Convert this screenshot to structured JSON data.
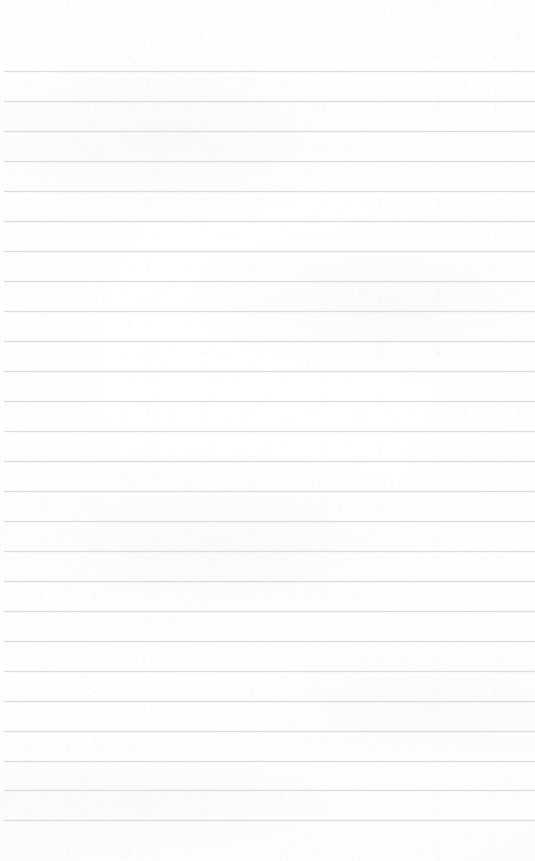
{
  "document": {
    "type": "lined-notepad-page",
    "title": "",
    "body_text": "",
    "page_number": "",
    "header_text": "",
    "footer_text": "",
    "is_blank": true
  },
  "canvas": {
    "width": 535,
    "height": 861
  },
  "paper": {
    "background_color": "#fdfdfd",
    "edge_tint_color": "#f7f7f8",
    "texture_color": "#e2e4e7"
  },
  "ruling": {
    "line_color": "#d9dbde",
    "line_thickness": 1,
    "line_spacing": 30,
    "first_line_y": 71,
    "last_line_y": 820,
    "line_count": 26,
    "left_inset": 4,
    "right_inset": 0,
    "top_margin": 71,
    "bottom_margin": 41,
    "has_vertical_margin_rule": false,
    "lines_y": [
      71,
      101,
      131,
      161,
      191,
      221,
      251,
      281,
      311,
      341,
      371,
      401,
      431,
      461,
      491,
      521,
      551,
      581,
      611,
      641,
      671,
      701,
      731,
      761,
      790,
      820
    ]
  }
}
